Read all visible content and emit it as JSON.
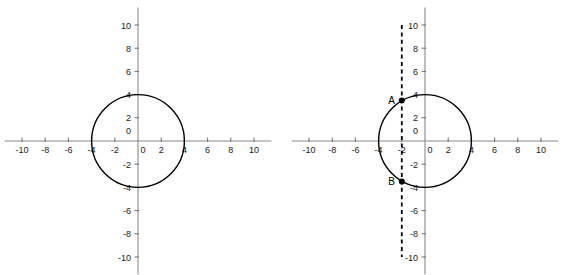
{
  "figure": {
    "title": "",
    "background_color": "#ffffff",
    "panel_count": 2
  },
  "style": {
    "axis_color": "#8a8a8a",
    "curve_color": "#000000",
    "dash_color": "#000000",
    "label_color": "#1a1a1a",
    "point_color": "#000000"
  },
  "chart_data": [
    {
      "type": "scatter",
      "name": "left-panel",
      "title": "",
      "xlabel": "",
      "ylabel": "",
      "xlim": [
        -11.5,
        11.5
      ],
      "ylim": [
        -11.5,
        11.5
      ],
      "grid": false,
      "legend": "none",
      "xticks": [
        -10,
        -8,
        -6,
        -4,
        -2,
        0,
        2,
        4,
        6,
        8,
        10
      ],
      "xtick_labels": [
        "-10",
        "-8",
        "-6",
        "-4",
        "-2",
        "0",
        "2",
        "4",
        "6",
        "8",
        "10"
      ],
      "yticks": [
        -10,
        -8,
        -6,
        -4,
        -2,
        0,
        2,
        4,
        6,
        8,
        10
      ],
      "ytick_labels": [
        "-10",
        "-8",
        "-6",
        "-4",
        "-2",
        "0",
        "2",
        "4",
        "6",
        "8",
        "10"
      ],
      "shapes": [
        {
          "kind": "circle",
          "center": [
            0,
            0
          ],
          "radius": 4,
          "stroke": "#000000",
          "fill": "none"
        }
      ],
      "points": [],
      "annotations": []
    },
    {
      "type": "scatter",
      "name": "right-panel",
      "title": "",
      "xlabel": "",
      "ylabel": "",
      "xlim": [
        -11.5,
        11.5
      ],
      "ylim": [
        -11.5,
        11.5
      ],
      "grid": false,
      "legend": "none",
      "xticks": [
        -10,
        -8,
        -6,
        -4,
        -2,
        0,
        2,
        4,
        6,
        8,
        10
      ],
      "xtick_labels": [
        "-10",
        "-8",
        "-6",
        "-4",
        "-2",
        "0",
        "2",
        "4",
        "6",
        "8",
        "10"
      ],
      "yticks": [
        -10,
        -8,
        -6,
        -4,
        -2,
        0,
        2,
        4,
        6,
        8,
        10
      ],
      "ytick_labels": [
        "-10",
        "-8",
        "-6",
        "-4",
        "-2",
        "0",
        "2",
        "4",
        "6",
        "8",
        "10"
      ],
      "shapes": [
        {
          "kind": "circle",
          "center": [
            0,
            0
          ],
          "radius": 4,
          "stroke": "#000000",
          "fill": "none"
        },
        {
          "kind": "vline",
          "x": -2,
          "y_from": -10,
          "y_to": 10,
          "style": "dashed",
          "stroke": "#000000"
        }
      ],
      "points": [
        {
          "label": "A",
          "x": -2,
          "y": 3.5
        },
        {
          "label": "B",
          "x": -2,
          "y": -3.5
        }
      ],
      "annotations": [
        {
          "text": "A",
          "x": -2,
          "y": 3.5,
          "position": "left"
        },
        {
          "text": "B",
          "x": -2,
          "y": -3.5,
          "position": "left"
        }
      ]
    }
  ]
}
